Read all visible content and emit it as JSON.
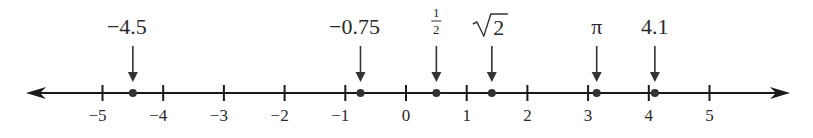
{
  "diagram": {
    "type": "number_line",
    "axis": {
      "min": -5,
      "max": 5,
      "y": 93,
      "x_origin": 406,
      "unit_px": 60.7,
      "left_end": 26,
      "right_end": 790,
      "color": "#1a1a1a"
    },
    "ticks": [
      {
        "value": -5,
        "label": "−5"
      },
      {
        "value": -4,
        "label": "−4"
      },
      {
        "value": -3,
        "label": "−3"
      },
      {
        "value": -2,
        "label": "−2"
      },
      {
        "value": -1,
        "label": "−1"
      },
      {
        "value": 0,
        "label": "0"
      },
      {
        "value": 1,
        "label": "1"
      },
      {
        "value": 2,
        "label": "2"
      },
      {
        "value": 3,
        "label": "3"
      },
      {
        "value": 4,
        "label": "4"
      },
      {
        "value": 5,
        "label": "5"
      }
    ],
    "points": [
      {
        "id": "neg-4-5",
        "value": -4.5,
        "label": "−4.5",
        "kind": "text"
      },
      {
        "id": "neg-0-75",
        "value": -0.75,
        "label": "−0.75",
        "kind": "text"
      },
      {
        "id": "half",
        "value": 0.5,
        "label": "1/2",
        "kind": "fraction",
        "numerator": "1",
        "denominator": "2"
      },
      {
        "id": "sqrt2",
        "value": 1.41421,
        "label": "√2",
        "kind": "sqrt",
        "radicand": "2"
      },
      {
        "id": "pi",
        "value": 3.14159,
        "label": "π",
        "kind": "text"
      },
      {
        "id": "four-point-one",
        "value": 4.1,
        "label": "4.1",
        "kind": "text"
      }
    ]
  }
}
